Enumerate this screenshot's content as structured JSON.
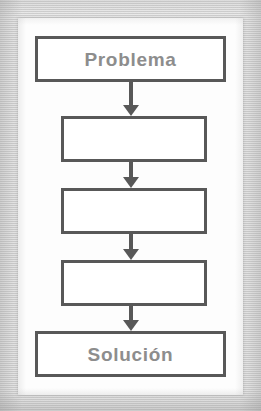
{
  "figure": {
    "type": "flowchart",
    "orientation": "vertical-top-to-bottom",
    "language": "es",
    "background_color": "#d7d7d7",
    "panel_color": "#fdfdfd",
    "node_border_color": "#585858",
    "node_fill_color": "#ffffff",
    "label_color": "#8d8d8d",
    "arrow_color": "#585858",
    "nodes": [
      {
        "id": "node-problema",
        "label": "Problema",
        "shape": "rectangle",
        "width": "wide",
        "has_label": true
      },
      {
        "id": "node-step-1",
        "label": "",
        "shape": "rectangle",
        "width": "narrow",
        "has_label": false
      },
      {
        "id": "node-step-2",
        "label": "",
        "shape": "rectangle",
        "width": "narrow",
        "has_label": false
      },
      {
        "id": "node-step-3",
        "label": "",
        "shape": "rectangle",
        "width": "narrow",
        "has_label": false
      },
      {
        "id": "node-solucion",
        "label": "Solución",
        "shape": "rectangle",
        "width": "wide",
        "has_label": true
      }
    ],
    "connectors": [
      {
        "id": "arrow-1",
        "from": "node-problema",
        "to": "node-step-1",
        "style": "solid-down-arrow"
      },
      {
        "id": "arrow-2",
        "from": "node-step-1",
        "to": "node-step-2",
        "style": "solid-down-arrow"
      },
      {
        "id": "arrow-3",
        "from": "node-step-2",
        "to": "node-step-3",
        "style": "solid-down-arrow"
      },
      {
        "id": "arrow-4",
        "from": "node-step-3",
        "to": "node-solucion",
        "style": "solid-down-arrow"
      }
    ]
  }
}
